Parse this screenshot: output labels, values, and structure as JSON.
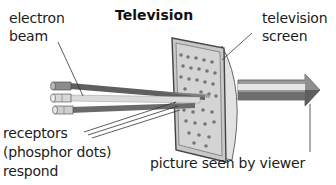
{
  "diagram": {
    "title": "Television",
    "labels": {
      "electron_beam_line1": "electron",
      "electron_beam_line2": "beam",
      "tv_screen_line1": "television",
      "tv_screen_line2": "screen",
      "receptors_line1": "receptors",
      "receptors_line2": "(phosphor dots)",
      "receptors_line3": "respond",
      "picture": "picture seen by viewer"
    },
    "components": {
      "electron_guns": 3,
      "beams": 3,
      "output_arrow": "arrow pointing right toward viewer"
    },
    "colors": {
      "beam_dark": "#5f5f5f",
      "beam_light": "#d9d9d9",
      "beam_mid": "#8a8a8a",
      "screen_fill": "#cfcfcf",
      "screen_edge": "#6d6d6d",
      "phosphor_dot": "#777777"
    }
  }
}
